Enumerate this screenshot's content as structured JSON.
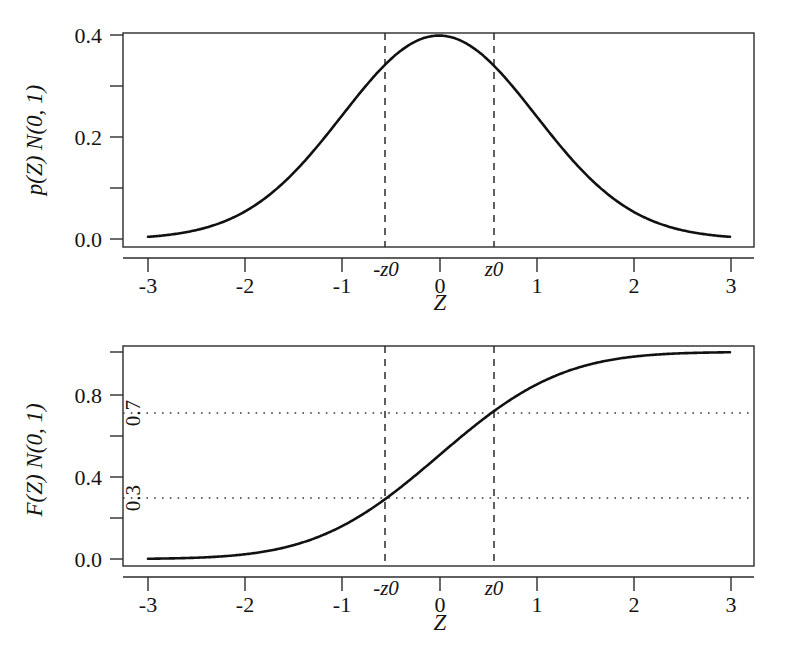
{
  "figure": {
    "background_color": "#ffffff",
    "ink_color": "#141414",
    "panel_count": 2
  },
  "panels": {
    "top": {
      "name": "standard-normal-pdf",
      "ylabel": "p(Z) N(0, 1)",
      "xlabel": "Z",
      "ytick_labels": [
        "0.0",
        "0.2",
        "0.4"
      ],
      "xtick_labels": [
        "-3",
        "-2",
        "-1",
        "0",
        "1",
        "2",
        "3"
      ],
      "marker_labels": [
        "-z0",
        "z0"
      ]
    },
    "bottom": {
      "name": "standard-normal-cdf",
      "ylabel": "F(Z) N(0, 1)",
      "xlabel": "Z",
      "ytick_labels": [
        "0.0",
        "0.4",
        "0.8"
      ],
      "xtick_labels": [
        "-3",
        "-2",
        "-1",
        "0",
        "1",
        "2",
        "3"
      ],
      "marker_labels": [
        "-z0",
        "z0"
      ],
      "inline_labels": [
        "0.7",
        "0.3"
      ]
    }
  },
  "chart_data": [
    {
      "type": "line",
      "id": "pdf-panel",
      "title": "",
      "xlabel": "Z",
      "ylabel": "p(Z) N(0, 1)",
      "xlim": [
        -3.3,
        3.3
      ],
      "ylim": [
        -0.012,
        0.425
      ],
      "xticks": [
        -3,
        -2,
        -1,
        0,
        1,
        2,
        3
      ],
      "xtick_labels": [
        "-3",
        "-2",
        "-1",
        "0",
        "1",
        "2",
        "3"
      ],
      "yticks": [
        0.0,
        0.1,
        0.2,
        0.3,
        0.4
      ],
      "ytick_labels": [
        "0.0",
        "",
        "0.2",
        "",
        "0.4"
      ],
      "grid": false,
      "legend": "none",
      "series": [
        {
          "name": "standard normal density",
          "x": [
            -3.0,
            -2.8,
            -2.6,
            -2.4,
            -2.2,
            -2.0,
            -1.8,
            -1.6,
            -1.4,
            -1.2,
            -1.0,
            -0.8,
            -0.6,
            -0.4,
            -0.2,
            0.0,
            0.2,
            0.4,
            0.6,
            0.8,
            1.0,
            1.2,
            1.4,
            1.6,
            1.8,
            2.0,
            2.2,
            2.4,
            2.6,
            2.8,
            3.0
          ],
          "values": [
            0.0044,
            0.0079,
            0.0136,
            0.0224,
            0.0355,
            0.054,
            0.079,
            0.1109,
            0.1497,
            0.1942,
            0.242,
            0.2897,
            0.3332,
            0.3683,
            0.391,
            0.3989,
            0.391,
            0.3683,
            0.3332,
            0.2897,
            0.242,
            0.1942,
            0.1497,
            0.1109,
            0.079,
            0.054,
            0.0355,
            0.0224,
            0.0136,
            0.0079,
            0.0044
          ]
        }
      ],
      "annotations": [
        {
          "kind": "vline",
          "label": "-z0",
          "x": -0.5244,
          "style": "dashed"
        },
        {
          "kind": "vline",
          "label": "z0",
          "x": 0.5244,
          "style": "dashed"
        }
      ]
    },
    {
      "type": "line",
      "id": "cdf-panel",
      "title": "",
      "xlabel": "Z",
      "ylabel": "F(Z) N(0, 1)",
      "xlim": [
        -3.3,
        3.3
      ],
      "ylim": [
        -0.03,
        1.05
      ],
      "xticks": [
        -3,
        -2,
        -1,
        0,
        1,
        2,
        3
      ],
      "xtick_labels": [
        "-3",
        "-2",
        "-1",
        "0",
        "1",
        "2",
        "3"
      ],
      "yticks": [
        0.0,
        0.2,
        0.4,
        0.6,
        0.8,
        1.0
      ],
      "ytick_labels": [
        "0.0",
        "",
        "0.4",
        "",
        "0.8",
        ""
      ],
      "grid": false,
      "legend": "none",
      "series": [
        {
          "name": "standard normal distribution function",
          "x": [
            -3.0,
            -2.8,
            -2.6,
            -2.4,
            -2.2,
            -2.0,
            -1.8,
            -1.6,
            -1.4,
            -1.2,
            -1.0,
            -0.8,
            -0.6,
            -0.4,
            -0.2,
            0.0,
            0.2,
            0.4,
            0.6,
            0.8,
            1.0,
            1.2,
            1.4,
            1.6,
            1.8,
            2.0,
            2.2,
            2.4,
            2.6,
            2.8,
            3.0
          ],
          "values": [
            0.0013,
            0.0026,
            0.0047,
            0.0082,
            0.0139,
            0.0228,
            0.0359,
            0.0548,
            0.0808,
            0.1151,
            0.1587,
            0.2119,
            0.2743,
            0.3446,
            0.4207,
            0.5,
            0.5793,
            0.6554,
            0.7257,
            0.7881,
            0.8413,
            0.8849,
            0.9192,
            0.9452,
            0.9641,
            0.9772,
            0.9861,
            0.9918,
            0.9953,
            0.9974,
            0.9987
          ]
        }
      ],
      "annotations": [
        {
          "kind": "vline",
          "label": "-z0",
          "x": -0.5244,
          "style": "dashed"
        },
        {
          "kind": "vline",
          "label": "z0",
          "x": 0.5244,
          "style": "dashed"
        },
        {
          "kind": "hline",
          "label": "0.7",
          "y": 0.7,
          "style": "dotted"
        },
        {
          "kind": "hline",
          "label": "0.3",
          "y": 0.3,
          "style": "dotted"
        }
      ]
    }
  ]
}
